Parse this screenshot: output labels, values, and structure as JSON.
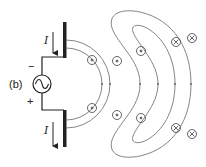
{
  "figure": {
    "panel_label": "(b)",
    "current_label_top": "I",
    "current_label_bottom": "I",
    "polarity_top": "−",
    "polarity_bottom": "+",
    "source_symbol": "ac-source",
    "colors": {
      "ink": "#222222",
      "field_line": "#777777",
      "background": "#ffffff"
    },
    "field_symbols": {
      "out_of_page": [
        {
          "x": 92,
          "y": 60
        },
        {
          "x": 92,
          "y": 108
        },
        {
          "x": 117,
          "y": 61
        },
        {
          "x": 117,
          "y": 115
        },
        {
          "x": 141,
          "y": 51
        },
        {
          "x": 141,
          "y": 118
        }
      ],
      "into_page": [
        {
          "x": 176,
          "y": 42
        },
        {
          "x": 192,
          "y": 38
        },
        {
          "x": 176,
          "y": 128
        },
        {
          "x": 192,
          "y": 134
        }
      ]
    }
  }
}
